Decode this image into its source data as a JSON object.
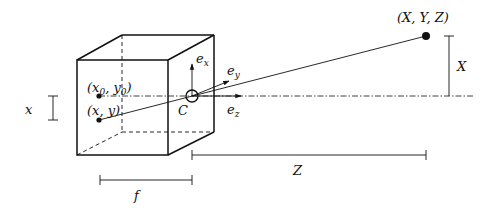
{
  "diagram": {
    "colors": {
      "stroke": "#111111",
      "background": "#ffffff"
    },
    "labels": {
      "world_point": "(X, Y, Z)",
      "image_point": "(x, y)",
      "principal_point": "(x0, y0)",
      "principal_point_parts": {
        "open": "(x",
        "sub0": "0",
        "mid": ", y",
        "sub1": "0",
        "close": ")"
      },
      "camera_center": "C",
      "axis_x": {
        "base": "e",
        "sub": "x"
      },
      "axis_y": {
        "base": "e",
        "sub": "y"
      },
      "axis_z": {
        "base": "e",
        "sub": "z"
      },
      "focal_length": "f",
      "depth": "Z",
      "world_height": "X",
      "image_height": "x"
    }
  }
}
